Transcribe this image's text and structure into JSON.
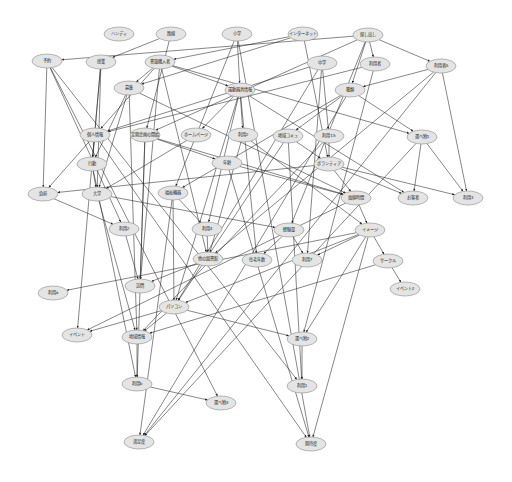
{
  "diagram": {
    "type": "directed-graph",
    "nodes": [
      {
        "id": "n0",
        "label": "ハンディ",
        "x": 119,
        "y": 34
      },
      {
        "id": "n1",
        "label": "路線",
        "x": 171,
        "y": 34
      },
      {
        "id": "n2",
        "label": "小学",
        "x": 237,
        "y": 34
      },
      {
        "id": "n3",
        "label": "インターネット",
        "x": 303,
        "y": 34
      },
      {
        "id": "n4",
        "label": "探し出し",
        "x": 368,
        "y": 35
      },
      {
        "id": "n5",
        "label": "予約",
        "x": 47,
        "y": 61
      },
      {
        "id": "n6",
        "label": "授業",
        "x": 101,
        "y": 62
      },
      {
        "id": "n7",
        "label": "書籍購入者",
        "x": 160,
        "y": 62
      },
      {
        "id": "n8",
        "label": "中学",
        "x": 322,
        "y": 63
      },
      {
        "id": "n9",
        "label": "利用者",
        "x": 375,
        "y": 64
      },
      {
        "id": "n10",
        "label": "利用者A",
        "x": 441,
        "y": 66
      },
      {
        "id": "n11",
        "label": "募集",
        "x": 129,
        "y": 88
      },
      {
        "id": "n12",
        "label": "運動器具情報",
        "x": 240,
        "y": 90
      },
      {
        "id": "n13",
        "label": "種類",
        "x": 350,
        "y": 90
      },
      {
        "id": "n14",
        "label": "個人情報",
        "x": 95,
        "y": 135
      },
      {
        "id": "n15",
        "label": "定期企画の開始",
        "x": 145,
        "y": 135
      },
      {
        "id": "n16",
        "label": "ホームページ",
        "x": 196,
        "y": 135
      },
      {
        "id": "n17",
        "label": "利用2",
        "x": 243,
        "y": 135
      },
      {
        "id": "n18",
        "label": "地域コミュ",
        "x": 288,
        "y": 136
      },
      {
        "id": "n19",
        "label": "利用15",
        "x": 329,
        "y": 136
      },
      {
        "id": "n20",
        "label": "選べ物1",
        "x": 422,
        "y": 137
      },
      {
        "id": "n21",
        "label": "年齢",
        "x": 227,
        "y": 163
      },
      {
        "id": "n22",
        "label": "ボランティア",
        "x": 329,
        "y": 164
      },
      {
        "id": "n23",
        "label": "行動",
        "x": 92,
        "y": 164
      },
      {
        "id": "n24",
        "label": "負担",
        "x": 43,
        "y": 194
      },
      {
        "id": "n25",
        "label": "大学",
        "x": 97,
        "y": 194
      },
      {
        "id": "n26",
        "label": "福祉機器",
        "x": 173,
        "y": 193
      },
      {
        "id": "n27",
        "label": "価値時間",
        "x": 356,
        "y": 198
      },
      {
        "id": "n28",
        "label": "お客者",
        "x": 413,
        "y": 198
      },
      {
        "id": "n29",
        "label": "利用3",
        "x": 468,
        "y": 198
      },
      {
        "id": "n30",
        "label": "利用2",
        "x": 124,
        "y": 229
      },
      {
        "id": "n31",
        "label": "利用4",
        "x": 207,
        "y": 229
      },
      {
        "id": "n32",
        "label": "経験量",
        "x": 289,
        "y": 230
      },
      {
        "id": "n33",
        "label": "イメージ",
        "x": 370,
        "y": 230
      },
      {
        "id": "n34",
        "label": "他の図書館",
        "x": 208,
        "y": 259
      },
      {
        "id": "n35",
        "label": "住宅年数",
        "x": 257,
        "y": 260
      },
      {
        "id": "n36",
        "label": "利用7",
        "x": 307,
        "y": 260
      },
      {
        "id": "n37",
        "label": "サークル",
        "x": 388,
        "y": 261
      },
      {
        "id": "n38",
        "label": "イベント2",
        "x": 405,
        "y": 289
      },
      {
        "id": "n39",
        "label": "利用a",
        "x": 53,
        "y": 293
      },
      {
        "id": "n40",
        "label": "訪問",
        "x": 140,
        "y": 286
      },
      {
        "id": "n41",
        "label": "パソコン",
        "x": 174,
        "y": 307
      },
      {
        "id": "n42",
        "label": "選べ物2",
        "x": 302,
        "y": 339
      },
      {
        "id": "n43",
        "label": "イベント",
        "x": 77,
        "y": 335
      },
      {
        "id": "n44",
        "label": "地域情報",
        "x": 137,
        "y": 337
      },
      {
        "id": "n45",
        "label": "利用b",
        "x": 137,
        "y": 384
      },
      {
        "id": "n46",
        "label": "選べ物3",
        "x": 221,
        "y": 403
      },
      {
        "id": "n47",
        "label": "利用1",
        "x": 302,
        "y": 386
      },
      {
        "id": "n48",
        "label": "満足度",
        "x": 139,
        "y": 442
      },
      {
        "id": "n49",
        "label": "期待度",
        "x": 311,
        "y": 444
      }
    ],
    "edges": [
      [
        "n1",
        "n6"
      ],
      [
        "n1",
        "n15"
      ],
      [
        "n2",
        "n12"
      ],
      [
        "n2",
        "n26"
      ],
      [
        "n2",
        "n49"
      ],
      [
        "n3",
        "n7"
      ],
      [
        "n3",
        "n22"
      ],
      [
        "n3",
        "n11"
      ],
      [
        "n4",
        "n9"
      ],
      [
        "n4",
        "n10"
      ],
      [
        "n4",
        "n13"
      ],
      [
        "n4",
        "n5"
      ],
      [
        "n4",
        "n15"
      ],
      [
        "n4",
        "n32"
      ],
      [
        "n5",
        "n24"
      ],
      [
        "n5",
        "n30"
      ],
      [
        "n5",
        "n46"
      ],
      [
        "n5",
        "n47"
      ],
      [
        "n6",
        "n25"
      ],
      [
        "n6",
        "n23"
      ],
      [
        "n6",
        "n43"
      ],
      [
        "n7",
        "n11"
      ],
      [
        "n7",
        "n12"
      ],
      [
        "n7",
        "n20"
      ],
      [
        "n7",
        "n14"
      ],
      [
        "n7",
        "n40"
      ],
      [
        "n7",
        "n34"
      ],
      [
        "n8",
        "n19"
      ],
      [
        "n8",
        "n14"
      ],
      [
        "n8",
        "n41"
      ],
      [
        "n8",
        "n36"
      ],
      [
        "n9",
        "n14"
      ],
      [
        "n9",
        "n42"
      ],
      [
        "n10",
        "n13"
      ],
      [
        "n10",
        "n29"
      ],
      [
        "n10",
        "n48"
      ],
      [
        "n10",
        "n34"
      ],
      [
        "n11",
        "n23"
      ],
      [
        "n11",
        "n25"
      ],
      [
        "n11",
        "n44"
      ],
      [
        "n11",
        "n27"
      ],
      [
        "n12",
        "n16"
      ],
      [
        "n12",
        "n17"
      ],
      [
        "n12",
        "n31"
      ],
      [
        "n12",
        "n28"
      ],
      [
        "n12",
        "n35"
      ],
      [
        "n12",
        "n41"
      ],
      [
        "n13",
        "n18"
      ],
      [
        "n13",
        "n20"
      ],
      [
        "n13",
        "n48"
      ],
      [
        "n13",
        "n26"
      ],
      [
        "n14",
        "n23"
      ],
      [
        "n14",
        "n24"
      ],
      [
        "n14",
        "n49"
      ],
      [
        "n15",
        "n21"
      ],
      [
        "n15",
        "n40"
      ],
      [
        "n15",
        "n45"
      ],
      [
        "n15",
        "n27"
      ],
      [
        "n16",
        "n25"
      ],
      [
        "n17",
        "n33"
      ],
      [
        "n17",
        "n34"
      ],
      [
        "n18",
        "n22"
      ],
      [
        "n18",
        "n41"
      ],
      [
        "n18",
        "n47"
      ],
      [
        "n19",
        "n22"
      ],
      [
        "n19",
        "n44"
      ],
      [
        "n20",
        "n29"
      ],
      [
        "n20",
        "n48"
      ],
      [
        "n20",
        "n28"
      ],
      [
        "n21",
        "n27"
      ],
      [
        "n21",
        "n49"
      ],
      [
        "n22",
        "n27"
      ],
      [
        "n22",
        "n28"
      ],
      [
        "n22",
        "n29"
      ],
      [
        "n22",
        "n24"
      ],
      [
        "n23",
        "n25"
      ],
      [
        "n23",
        "n45"
      ],
      [
        "n24",
        "n30"
      ],
      [
        "n25",
        "n32"
      ],
      [
        "n25",
        "n44"
      ],
      [
        "n26",
        "n31"
      ],
      [
        "n26",
        "n41"
      ],
      [
        "n26",
        "n48"
      ],
      [
        "n27",
        "n33"
      ],
      [
        "n27",
        "n43"
      ],
      [
        "n30",
        "n40"
      ],
      [
        "n31",
        "n34"
      ],
      [
        "n32",
        "n36"
      ],
      [
        "n32",
        "n35"
      ],
      [
        "n33",
        "n36"
      ],
      [
        "n33",
        "n37"
      ],
      [
        "n33",
        "n42"
      ],
      [
        "n33",
        "n39"
      ],
      [
        "n33",
        "n49"
      ],
      [
        "n33",
        "n41"
      ],
      [
        "n34",
        "n40"
      ],
      [
        "n37",
        "n38"
      ],
      [
        "n37",
        "n44"
      ],
      [
        "n41",
        "n43"
      ],
      [
        "n41",
        "n44"
      ],
      [
        "n41",
        "n42"
      ],
      [
        "n42",
        "n47"
      ],
      [
        "n44",
        "n45"
      ],
      [
        "n45",
        "n46"
      ]
    ]
  }
}
